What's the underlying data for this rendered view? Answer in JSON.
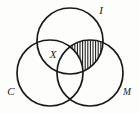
{
  "figure": {
    "name": "three-circle-venn-diagram",
    "background_color": "#fdfdfb",
    "stroke_color": "#1a1a1a",
    "width": 139,
    "height": 113
  },
  "circles": [
    {
      "id": "I",
      "label": "I",
      "cx": 70,
      "cy": 41,
      "r": 33,
      "label_x": 101,
      "label_y": 14,
      "position": "top"
    },
    {
      "id": "C",
      "label": "C",
      "cx": 50,
      "cy": 73,
      "r": 33,
      "label_x": 8,
      "label_y": 95,
      "position": "bottom-left"
    },
    {
      "id": "M",
      "label": "M",
      "cx": 90,
      "cy": 73,
      "r": 33,
      "label_x": 122,
      "label_y": 95,
      "position": "bottom-right"
    }
  ],
  "region_labels": [
    {
      "id": "X",
      "label": "X",
      "x": 50,
      "y": 58,
      "describes": "intersection-of-I-and-C"
    }
  ],
  "shaded_region": {
    "id": "I-intersect-M-minus-C",
    "description": "I ∩ M excluding C",
    "pattern": "vertical-hatching",
    "hatch_spacing": 2.6,
    "hatch_color": "#1a1a1a"
  }
}
